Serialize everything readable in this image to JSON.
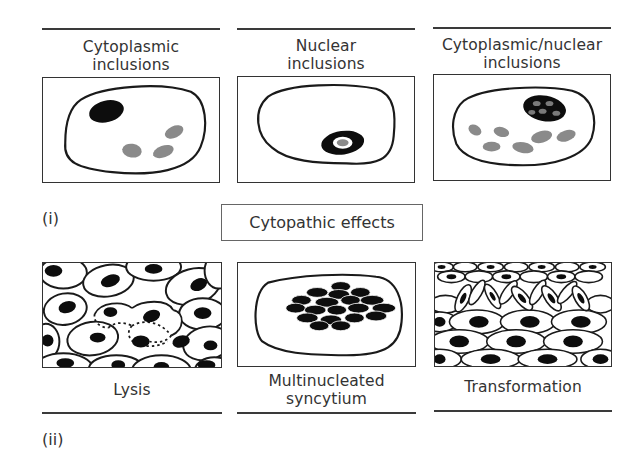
{
  "figure": {
    "center_label": "Cytopathic effects",
    "part_labels": {
      "top": "(i)",
      "bottom": "(ii)"
    },
    "top_row": [
      {
        "id": "cytoplasmic",
        "title_line1": "Cytoplasmic",
        "title_line2": "inclusions"
      },
      {
        "id": "nuclear",
        "title_line1": "Nuclear",
        "title_line2": "inclusions"
      },
      {
        "id": "cytoplasmic-nuclear",
        "title_line1": "Cytoplasmic/nuclear",
        "title_line2": "inclusions"
      }
    ],
    "bottom_row": [
      {
        "id": "lysis",
        "title_line1": "Lysis",
        "title_line2": ""
      },
      {
        "id": "syncytium",
        "title_line1": "Multinucleated",
        "title_line2": "syncytium"
      },
      {
        "id": "transformation",
        "title_line1": "Transformation",
        "title_line2": ""
      }
    ],
    "colors": {
      "outline": "#1a1a1a",
      "nucleus": "#0d0d0d",
      "inclusion": "#8a8a8a",
      "background": "#ffffff"
    }
  }
}
